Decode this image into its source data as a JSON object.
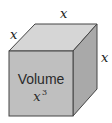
{
  "diagram": {
    "labels": {
      "left_edge": "x",
      "top_edge": "x",
      "right_edge": "x"
    },
    "front_face": {
      "text": "Volume",
      "formula_base": "x",
      "formula_exponent": "3"
    },
    "colors": {
      "front_face": "#bfbfbf",
      "top_face": "#d6d6d6",
      "right_face": "#a9a9a9",
      "edge": "#444444"
    }
  }
}
